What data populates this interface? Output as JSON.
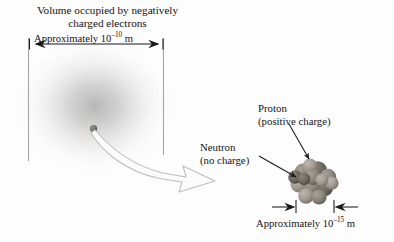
{
  "figure": {
    "background_color": "#fdfdfd",
    "width": 394,
    "height": 242
  },
  "electron_cloud": {
    "caption_line1": "Volume occupied by negatively",
    "caption_line2": "charged electrons",
    "dimension_label_prefix": "Approximately 10",
    "dimension_label_exponent": "–10",
    "dimension_label_suffix": " m",
    "dimension_value": "Approximately 10⁻¹⁰ m",
    "cloud_color": "#c9c9c9",
    "boundary_color": "#9a9a9a",
    "nucleus_dot_color": "#6e6a66"
  },
  "zoom_arrow": {
    "name": "magnification-arrow",
    "fill_color": "#fbfbfb",
    "stroke_color": "#b8b8b8"
  },
  "nucleus": {
    "proton_label_line1": "Proton",
    "proton_label_line2": "(positive charge)",
    "neutron_label_line1": "Neutron",
    "neutron_label_line2": "(no charge)",
    "dimension_label_prefix": "Approximately 10",
    "dimension_label_exponent": "–15",
    "dimension_label_suffix": " m",
    "dimension_value": "Approximately 10⁻¹⁵ m",
    "particle_color_dark": "#6b6761",
    "particle_color_mid": "#8d8880",
    "particle_color_light": "#a8a29a",
    "leader_line_color": "#1a1a1a"
  }
}
